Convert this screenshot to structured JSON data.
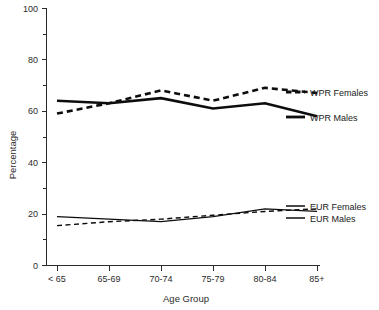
{
  "chart_data": {
    "type": "line",
    "title": "",
    "xlabel": "Age Group",
    "ylabel": "Percentage",
    "categories": [
      "< 65",
      "65-69",
      "70-74",
      "75-79",
      "80-84",
      "85+"
    ],
    "ylim": [
      0,
      100
    ],
    "yticks": [
      0,
      20,
      40,
      60,
      80,
      100
    ],
    "ytick_labels": [
      "0",
      "20",
      "40",
      "60",
      "80",
      "100"
    ],
    "minor_yticks": [
      10,
      30,
      50,
      70,
      90
    ],
    "grid": false,
    "legend_position": "right-inline",
    "series": [
      {
        "name": "WPR Females",
        "style": "dashed",
        "weight": "thick",
        "values": [
          59,
          63,
          68,
          64,
          69,
          67
        ]
      },
      {
        "name": "WPR Males",
        "style": "solid",
        "weight": "thick",
        "values": [
          64,
          63,
          65,
          61,
          63,
          58
        ]
      },
      {
        "name": "EUR Females",
        "style": "dashed",
        "weight": "thin",
        "values": [
          15.5,
          17,
          18,
          19.5,
          21,
          22
        ]
      },
      {
        "name": "EUR Males",
        "style": "solid",
        "weight": "thin",
        "values": [
          19,
          18,
          17,
          19,
          22,
          21
        ]
      }
    ]
  },
  "axes": {
    "y_title": "Percentage",
    "x_title": "Age Group",
    "y_labels": [
      "100",
      "80",
      "60",
      "40",
      "20",
      "0"
    ],
    "x_labels": [
      "< 65",
      "65-69",
      "70-74",
      "75-79",
      "80-84",
      "85+"
    ]
  },
  "legend": {
    "items": [
      {
        "label": "WPR Females"
      },
      {
        "label": "WPR Males"
      },
      {
        "label": "EUR Females"
      },
      {
        "label": "EUR Males"
      }
    ]
  },
  "colors": {
    "ink": "#0d0d0d",
    "axis": "#2b2b2b",
    "background": "#ffffff"
  }
}
